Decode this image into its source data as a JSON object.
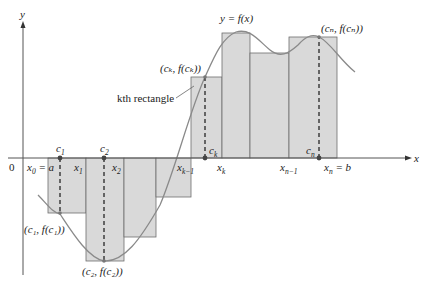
{
  "figure": {
    "axis": {
      "x_label": "x",
      "y_label": "y",
      "origin_label": "0"
    },
    "curve_label": "y = f(x)",
    "annotation": {
      "kth_rectangle": "kth rectangle"
    },
    "x_tick_labels": [
      {
        "main": "x",
        "sub": "0",
        "suffix": " = a"
      },
      {
        "main": "x",
        "sub": "1",
        "suffix": ""
      },
      {
        "main": "x",
        "sub": "2",
        "suffix": ""
      },
      {
        "main": "x",
        "sub": "k−1",
        "suffix": ""
      },
      {
        "main": "x",
        "sub": "k",
        "suffix": ""
      },
      {
        "main": "x",
        "sub": "n−1",
        "suffix": ""
      },
      {
        "main": "x",
        "sub": "n",
        "suffix": " = b"
      }
    ],
    "sample_points": [
      {
        "label_main": "c",
        "label_sub": "1",
        "point_label": "(c₁, f(c₁))"
      },
      {
        "label_main": "c",
        "label_sub": "2",
        "point_label": "(c₂, f(c₂))"
      },
      {
        "label_main": "c",
        "label_sub": "k",
        "point_label": "(cₖ, f(cₖ))"
      },
      {
        "label_main": "c",
        "label_sub": "n",
        "point_label": "(cₙ, f(cₙ))"
      }
    ],
    "colors": {
      "rect_fill": "#d9d9d9",
      "rect_stroke": "#6e6e6e",
      "curve": "#8a8a8a",
      "axis": "#555555",
      "point": "#555555"
    }
  }
}
